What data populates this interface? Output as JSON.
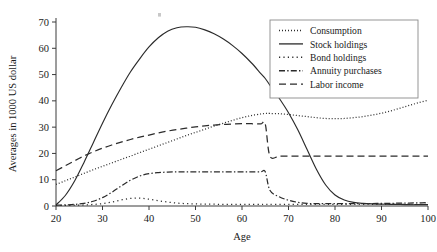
{
  "chart_data": {
    "type": "line",
    "title": "",
    "xlabel": "Age",
    "ylabel": "Averages in 1000 US dollar",
    "xlim": [
      20,
      100
    ],
    "ylim": [
      0,
      70
    ],
    "xticks": [
      20,
      30,
      40,
      50,
      60,
      70,
      80,
      90,
      100
    ],
    "yticks": [
      0,
      10,
      20,
      30,
      40,
      50,
      60,
      70
    ],
    "grid": false,
    "legend_position": "top-right",
    "x": [
      20,
      22,
      24,
      26,
      28,
      30,
      32,
      34,
      36,
      38,
      40,
      42,
      44,
      46,
      48,
      50,
      52,
      54,
      56,
      58,
      60,
      62,
      64,
      65,
      66,
      68,
      70,
      72,
      74,
      76,
      78,
      80,
      82,
      84,
      86,
      88,
      90,
      92,
      94,
      96,
      98,
      100
    ],
    "series": [
      {
        "name": "Consumption",
        "linestyle": "dotted",
        "values": [
          8.2,
          9.6,
          11.0,
          12.4,
          13.8,
          15.1,
          16.4,
          17.7,
          19.0,
          20.3,
          21.6,
          22.9,
          24.2,
          25.5,
          26.8,
          28.0,
          29.2,
          30.4,
          31.5,
          32.6,
          33.6,
          34.4,
          35.0,
          35.2,
          35.2,
          35.1,
          34.8,
          34.4,
          34.0,
          33.6,
          33.3,
          33.2,
          33.3,
          33.6,
          34.0,
          34.6,
          35.3,
          36.2,
          37.2,
          38.3,
          39.3,
          40.2
        ]
      },
      {
        "name": "Stock holdings",
        "linestyle": "solid",
        "values": [
          0.4,
          4.0,
          9.5,
          16.5,
          24.0,
          31.5,
          38.5,
          45.0,
          51.0,
          56.0,
          60.5,
          64.0,
          66.5,
          67.8,
          68.2,
          68.0,
          67.0,
          65.5,
          63.5,
          61.0,
          58.0,
          54.5,
          50.5,
          48.5,
          46.0,
          41.0,
          35.5,
          29.0,
          21.5,
          14.0,
          8.0,
          4.2,
          2.3,
          1.4,
          1.0,
          0.8,
          0.7,
          0.6,
          0.6,
          0.5,
          0.5,
          0.5
        ]
      },
      {
        "name": "Bond holdings",
        "linestyle": "densely-dotted",
        "values": [
          0.2,
          0.2,
          0.3,
          0.4,
          0.6,
          0.9,
          1.5,
          2.3,
          2.9,
          3.0,
          2.6,
          2.0,
          1.5,
          1.1,
          0.9,
          0.8,
          0.7,
          0.7,
          0.6,
          0.6,
          0.6,
          0.6,
          0.6,
          0.6,
          0.6,
          0.6,
          0.6,
          0.6,
          0.6,
          0.6,
          0.6,
          0.6,
          0.6,
          0.6,
          0.6,
          0.6,
          0.6,
          0.6,
          0.6,
          0.6,
          0.6,
          0.6
        ]
      },
      {
        "name": "Annuity purchases",
        "linestyle": "dash-dot",
        "values": [
          0.3,
          0.4,
          0.6,
          1.0,
          1.8,
          3.2,
          5.2,
          7.6,
          9.8,
          11.4,
          12.3,
          12.7,
          12.9,
          13.0,
          13.0,
          13.0,
          13.0,
          13.0,
          13.0,
          13.0,
          13.0,
          13.0,
          13.0,
          13.0,
          6.0,
          3.5,
          2.2,
          1.4,
          1.0,
          0.9,
          0.9,
          0.9,
          0.9,
          0.9,
          0.9,
          0.9,
          1.0,
          1.0,
          1.1,
          1.1,
          1.2,
          1.3
        ]
      },
      {
        "name": "Labor income",
        "linestyle": "dashed",
        "values": [
          13.4,
          15.3,
          17.2,
          19.0,
          20.6,
          22.0,
          23.2,
          24.3,
          25.3,
          26.2,
          27.0,
          27.8,
          28.5,
          29.1,
          29.6,
          30.1,
          30.5,
          30.8,
          31.0,
          31.2,
          31.3,
          31.3,
          31.2,
          31.2,
          19.0,
          19.0,
          19.0,
          19.0,
          19.0,
          19.0,
          19.0,
          19.0,
          19.0,
          19.0,
          19.0,
          19.0,
          19.0,
          19.0,
          19.0,
          19.0,
          19.0,
          19.0
        ]
      }
    ]
  },
  "legend": {
    "items": [
      {
        "label": "Consumption",
        "style": "dotted"
      },
      {
        "label": "Stock holdings",
        "style": "solid"
      },
      {
        "label": "Bond holdings",
        "style": "densely-dotted"
      },
      {
        "label": "Annuity purchases",
        "style": "dash-dot"
      },
      {
        "label": "Labor income",
        "style": "dashed"
      }
    ]
  }
}
